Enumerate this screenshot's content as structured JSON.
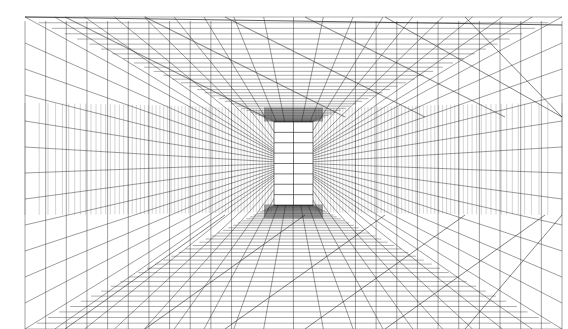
{
  "figure": {
    "kind": "one-point-perspective-grid",
    "width": 568,
    "height": 329,
    "background": "#ffffff",
    "line_color": "#1a1a1a",
    "vanishing_point": [
      293,
      163
    ],
    "frame": {
      "left": 25,
      "top": 17,
      "right": 562,
      "bottom": 340
    },
    "end_window": {
      "left": 274,
      "top": 122,
      "right": 313,
      "bottom": 205
    },
    "room_back": {
      "left": 25,
      "top": 103,
      "right": 562,
      "bottom": 215
    },
    "ceiling_rows": 12,
    "floor_rows": 14,
    "wall_columns": 26,
    "center_strip": {
      "top_left": 217,
      "top_right": 372,
      "bottom_left": 222,
      "bottom_right": 357
    }
  }
}
